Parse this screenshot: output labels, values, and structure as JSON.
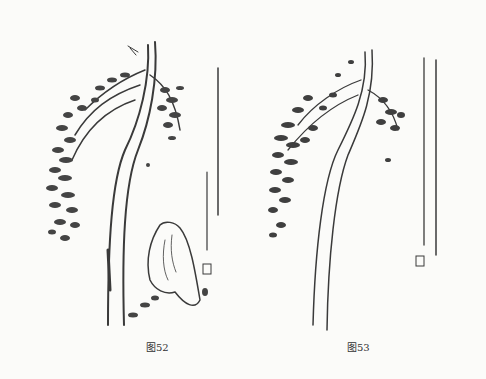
{
  "figures": [
    {
      "id": "fig52",
      "caption": "图52",
      "subject": "willow-branch-with-rock"
    },
    {
      "id": "fig53",
      "caption": "图53",
      "subject": "willow-branch"
    }
  ],
  "colors": {
    "ink": "#3a3a3a",
    "paper": "#fbfbf9"
  }
}
